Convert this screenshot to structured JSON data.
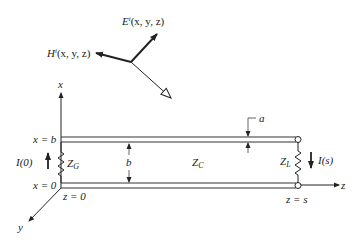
{
  "figure": {
    "type": "transmission-line-incident-field-diagram",
    "incident_field": {
      "E_label": "E",
      "E_sup": "i",
      "E_args": "(x, y, z)",
      "H_label": "H",
      "H_sup": "i",
      "H_args": "(x, y, z)"
    },
    "axes": {
      "x": "x",
      "y": "y",
      "z": "z"
    },
    "positions": {
      "x_eq_b": "x = b",
      "x_eq_0": "x = 0",
      "z_eq_0": "z = 0",
      "z_eq_s": "z = s"
    },
    "currents": {
      "source": "I(0)",
      "load": "I(s)"
    },
    "impedances": {
      "generator": "Z",
      "generator_sub": "G",
      "characteristic": "Z",
      "characteristic_sub": "C",
      "load": "Z",
      "load_sub": "L"
    },
    "dimensions": {
      "separation": "b",
      "radius": "a"
    },
    "colors": {
      "ink": "#222222",
      "background": "#ffffff"
    }
  }
}
